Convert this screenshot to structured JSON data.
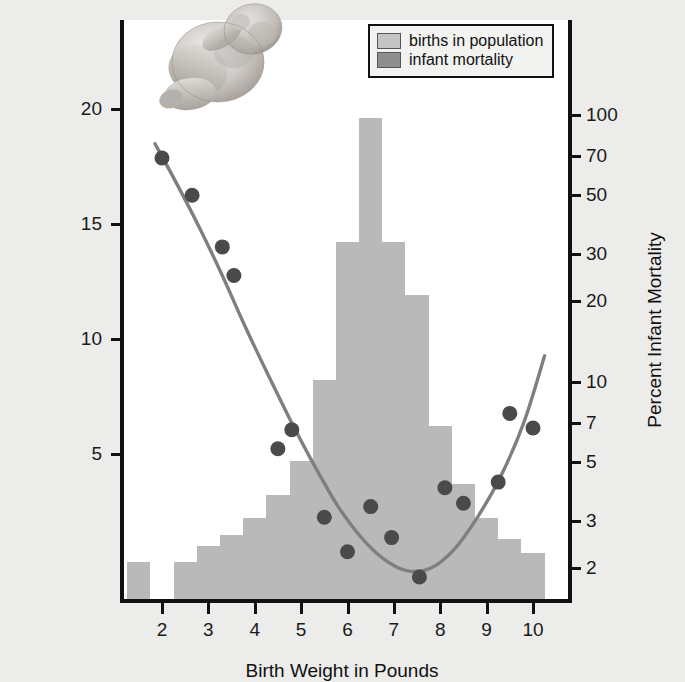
{
  "chart_data": {
    "type": "bar",
    "title": "",
    "subtitle": "",
    "xlabel": "Birth Weight in Pounds",
    "ylabel": "Percent of Births in Population",
    "ylabel_secondary": "Percent Infant Mortality",
    "xlim": [
      1.1,
      11.0
    ],
    "ylim": [
      0,
      23.5
    ],
    "ylim_secondary_log": [
      1.6,
      130
    ],
    "grid": false,
    "legend_position": "top-right",
    "xticks": [
      2,
      3,
      4,
      5,
      6,
      7,
      8,
      9,
      10
    ],
    "xtick_labels": [
      "2",
      "3",
      "4",
      "5",
      "6",
      "7",
      "8",
      "9",
      "10"
    ],
    "yticks_left": [
      5,
      10,
      15,
      20
    ],
    "ytick_labels_left": [
      "5",
      "10",
      "15",
      "20"
    ],
    "yticks_right": [
      2,
      3,
      5,
      7,
      10,
      20,
      30,
      50,
      70,
      100
    ],
    "ytick_labels_right": [
      "2",
      "3",
      "5",
      "7",
      "10",
      "20",
      "30",
      "50",
      "70",
      "100"
    ],
    "legend": [
      {
        "label": "births in population",
        "color": "#bdbdbd"
      },
      {
        "label": "infant mortality",
        "color": "#8e8e8e"
      }
    ],
    "series": [
      {
        "name": "births in population",
        "type": "bar",
        "axis": "left",
        "color": "#b9b9b9",
        "bin_width": 0.5,
        "bin_centers": [
          1.5,
          2.5,
          3.0,
          3.5,
          4.0,
          4.5,
          5.0,
          5.5,
          6.0,
          6.5,
          7.0,
          7.5,
          8.0,
          8.5,
          9.0,
          9.5,
          10.0
        ],
        "values": [
          0.3,
          0.3,
          1.0,
          1.5,
          2.2,
          3.2,
          4.7,
          8.2,
          14.2,
          19.6,
          14.2,
          11.9,
          6.2,
          3.7,
          2.2,
          1.3,
          0.7
        ]
      },
      {
        "name": "infant mortality",
        "type": "scatter",
        "axis": "right",
        "color": "#4a4a4a",
        "x": [
          2.0,
          2.65,
          3.3,
          3.55,
          4.5,
          4.8,
          5.5,
          6.0,
          6.5,
          6.95,
          7.55,
          8.1,
          8.5,
          9.25,
          9.5,
          10.0
        ],
        "y": [
          69,
          50,
          32,
          25,
          5.6,
          6.6,
          3.1,
          2.3,
          3.4,
          2.6,
          1.85,
          4.0,
          3.5,
          4.2,
          7.6,
          6.7
        ]
      },
      {
        "name": "infant mortality trend",
        "type": "line",
        "axis": "right",
        "color": "#808080",
        "x": [
          1.85,
          2.3,
          2.8,
          3.3,
          3.8,
          4.3,
          4.8,
          5.3,
          5.8,
          6.3,
          6.8,
          7.3,
          7.8,
          8.3,
          8.8,
          9.3,
          9.8,
          10.25
        ],
        "y": [
          78,
          56,
          38,
          25,
          16,
          10.5,
          7.0,
          4.8,
          3.4,
          2.6,
          2.15,
          1.95,
          2.0,
          2.35,
          3.1,
          4.4,
          7.0,
          12.5
        ]
      }
    ]
  },
  "legend": {
    "items": [
      {
        "label": "births in population",
        "swatch": "#bdbdbd"
      },
      {
        "label": "infant mortality",
        "swatch": "#8e8e8e"
      }
    ]
  },
  "axes": {
    "x_title": "Birth Weight in Pounds",
    "y_left_title": "Percent of Births in Population",
    "y_right_title": "Percent Infant Mortality"
  },
  "illustration": {
    "name": "newborn-infant-illustration",
    "description": "grayscale drawing of a curled newborn infant"
  }
}
